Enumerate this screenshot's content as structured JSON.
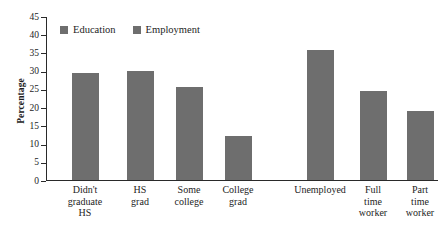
{
  "chart_data": {
    "type": "bar",
    "title": "",
    "subtitle": "",
    "xlabel": "",
    "ylabel": "Percentage",
    "ylim": [
      0,
      45
    ],
    "yticks": [
      0,
      5,
      10,
      15,
      20,
      25,
      30,
      35,
      40,
      45
    ],
    "grid": false,
    "legend_position": "inside top-left",
    "bar_color": "#6e6e6e",
    "axis_color": "#2a2a2a",
    "background_color": "#ffffff",
    "legend": [
      {
        "label": "Education",
        "color": "#6e6e6e"
      },
      {
        "label": "Employment",
        "color": "#6e6e6e"
      }
    ],
    "groups": [
      {
        "name": "Education",
        "categories": [
          "Didn't\ngraduate\nHS",
          "HS\ngrad",
          "Some\ncollege",
          "College\ngrad"
        ],
        "values": [
          29.3,
          29.8,
          25.4,
          12.0
        ]
      },
      {
        "name": "Employment",
        "categories": [
          "Unemployed",
          "Full\ntime\nworker",
          "Part\ntime\nworker"
        ],
        "values": [
          35.6,
          24.5,
          19.0
        ]
      }
    ],
    "categories": [
      "Didn't graduate HS",
      "HS grad",
      "Some college",
      "College grad",
      "Unemployed",
      "Full time worker",
      "Part time worker"
    ],
    "values": [
      29.3,
      29.8,
      25.4,
      12.0,
      35.6,
      24.5,
      19.0
    ],
    "bars": [
      {
        "label": "Didn't\ngraduate\nHS",
        "value": 29.3,
        "group": "Education",
        "center": 85,
        "width": 27,
        "label_width": 72
      },
      {
        "label": "HS\ngrad",
        "value": 29.8,
        "group": "Education",
        "center": 140,
        "width": 27,
        "label_width": 62
      },
      {
        "label": "Some\ncollege",
        "value": 25.4,
        "group": "Education",
        "center": 189,
        "width": 27,
        "label_width": 62
      },
      {
        "label": "College\ngrad",
        "value": 12.0,
        "group": "Education",
        "center": 238,
        "width": 27,
        "label_width": 62
      },
      {
        "label": "Unemployed",
        "value": 35.6,
        "group": "Employment",
        "center": 320,
        "width": 27,
        "label_width": 78
      },
      {
        "label": "Full\ntime\nworker",
        "value": 24.5,
        "group": "Employment",
        "center": 373,
        "width": 27,
        "label_width": 62
      },
      {
        "label": "Part\ntime\nworker",
        "value": 19.0,
        "group": "Employment",
        "center": 420,
        "width": 27,
        "label_width": 62
      }
    ]
  }
}
